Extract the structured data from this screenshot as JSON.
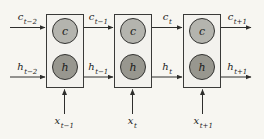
{
  "figure": {
    "colors": {
      "background": "#f7f6f1",
      "box_fill": "#f3f2ee",
      "box_border": "#3a3a38",
      "circle_border": "#333331",
      "c_circle_fill": "#b4b4ae",
      "h_circle_fill": "#98978f",
      "arrow": "#2e2e2c",
      "label_text": "#1c1c1a"
    },
    "rows": {
      "cell_state": {
        "labels": [
          {
            "base": "c",
            "sub": "t−2"
          },
          {
            "base": "c",
            "sub": "t−1"
          },
          {
            "base": "c",
            "sub": "t"
          },
          {
            "base": "c",
            "sub": "t+1"
          }
        ]
      },
      "hidden_state": {
        "labels": [
          {
            "base": "h",
            "sub": "t−2"
          },
          {
            "base": "h",
            "sub": "t−1"
          },
          {
            "base": "h",
            "sub": "t"
          },
          {
            "base": "h",
            "sub": "t+1"
          }
        ]
      },
      "input": {
        "labels": [
          {
            "base": "x",
            "sub": "t−1"
          },
          {
            "base": "x",
            "sub": "t"
          },
          {
            "base": "x",
            "sub": "t+1"
          }
        ]
      }
    },
    "cells": [
      {
        "c_label": "c",
        "h_label": "h"
      },
      {
        "c_label": "c",
        "h_label": "h"
      },
      {
        "c_label": "c",
        "h_label": "h"
      }
    ]
  }
}
